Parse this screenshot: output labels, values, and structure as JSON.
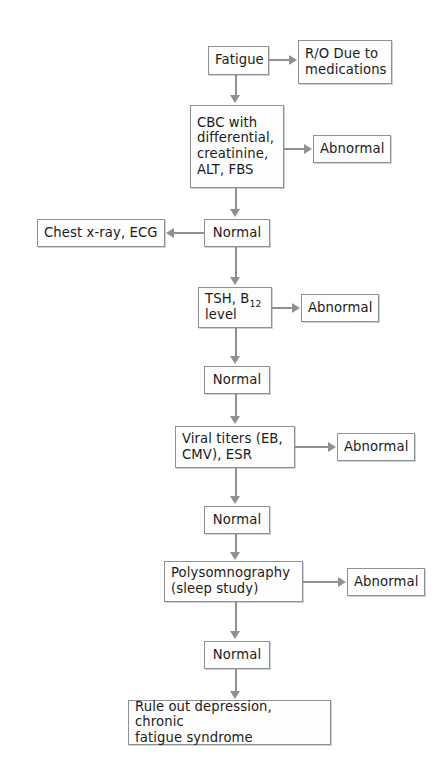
{
  "diagram": {
    "type": "flowchart",
    "colors": {
      "box_border": "#8d9094",
      "box_fill": "#fdfdfd",
      "connector": "#8d9094",
      "text": "#1b1b1b",
      "background": "#ffffff"
    },
    "nodes": {
      "fatigue": "Fatigue",
      "ro_medications": "R/O Due to\nmedications",
      "cbc_panel": "CBC with\ndifferential,\ncreatinine,\nALT, FBS",
      "abnormal_cbc": "Abnormal",
      "normal_1": "Normal",
      "chest_xray_ecg": "Chest x-ray, ECG",
      "tsh_b12_pre": "TSH, B",
      "tsh_b12_sub": "12",
      "tsh_b12_post": "\nlevel",
      "tsh_b12_full": "TSH, B12 level",
      "abnormal_tsh": "Abnormal",
      "normal_2": "Normal",
      "viral_titers": "Viral titers (EB,\nCMV), ESR",
      "abnormal_viral": "Abnormal",
      "normal_3": "Normal",
      "polysomnography": "Polysomnography\n(sleep study)",
      "abnormal_polysomnography": "Abnormal",
      "normal_4": "Normal",
      "rule_out_final": "Rule out depression, chronic\nfatigue syndrome"
    },
    "edges": [
      {
        "from": "fatigue",
        "to": "ro_medications",
        "direction": "right"
      },
      {
        "from": "fatigue",
        "to": "cbc_panel",
        "direction": "down"
      },
      {
        "from": "cbc_panel",
        "to": "abnormal_cbc",
        "direction": "right"
      },
      {
        "from": "cbc_panel",
        "to": "normal_1",
        "direction": "down"
      },
      {
        "from": "normal_1",
        "to": "chest_xray_ecg",
        "direction": "left"
      },
      {
        "from": "normal_1",
        "to": "tsh_b12_full",
        "direction": "down"
      },
      {
        "from": "tsh_b12_full",
        "to": "abnormal_tsh",
        "direction": "right"
      },
      {
        "from": "tsh_b12_full",
        "to": "normal_2",
        "direction": "down"
      },
      {
        "from": "normal_2",
        "to": "viral_titers",
        "direction": "down"
      },
      {
        "from": "viral_titers",
        "to": "abnormal_viral",
        "direction": "right"
      },
      {
        "from": "viral_titers",
        "to": "normal_3",
        "direction": "down"
      },
      {
        "from": "normal_3",
        "to": "polysomnography",
        "direction": "down"
      },
      {
        "from": "polysomnography",
        "to": "abnormal_polysomnography",
        "direction": "right"
      },
      {
        "from": "polysomnography",
        "to": "normal_4",
        "direction": "down"
      },
      {
        "from": "normal_4",
        "to": "rule_out_final",
        "direction": "down"
      }
    ]
  }
}
